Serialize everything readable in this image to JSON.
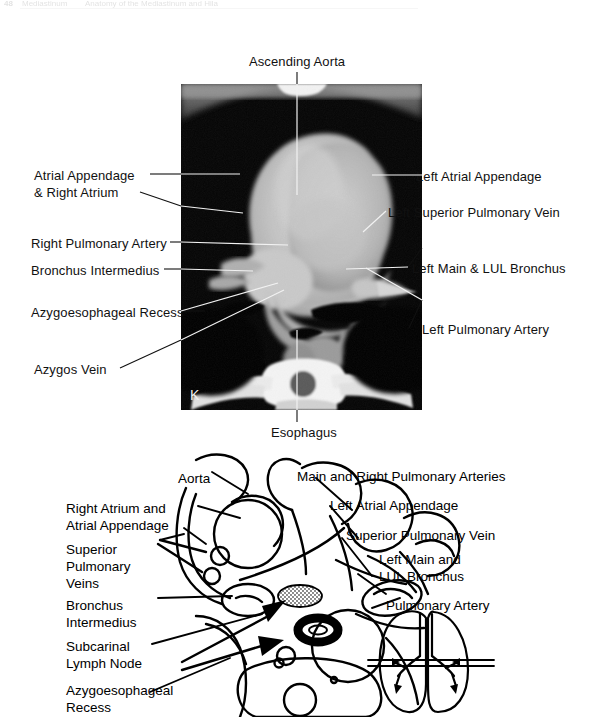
{
  "page": {
    "running_head": {
      "folio": "48",
      "part_a": "Mediastinum",
      "part_b": "Anatomy of the Mediastinum and Hila",
      "part_c": ""
    },
    "background": "#ffffff",
    "ink": "#111111"
  },
  "ct_panel": {
    "name": "coronal-ct-mediastinum",
    "orientation_marker": "K",
    "bounds": {
      "x": 181,
      "y": 84,
      "width": 241,
      "height": 326
    },
    "annotations": [
      {
        "id": "ascending-aorta",
        "text": "Ascending Aorta",
        "side": "top",
        "x": 249,
        "y": 54
      },
      {
        "id": "atrial-appendage-right-atrium",
        "text": "Atrial Appendage\n& Right Atrium",
        "side": "left",
        "x": 34,
        "y": 168
      },
      {
        "id": "right-pulmonary-artery",
        "text": "Right Pulmonary Artery",
        "side": "left",
        "x": 31,
        "y": 236
      },
      {
        "id": "bronchus-intermedius",
        "text": "Bronchus Intermedius",
        "side": "left",
        "x": 31,
        "y": 263
      },
      {
        "id": "azygoesophageal-recess",
        "text": "Azygoesophageal Recess",
        "side": "left",
        "x": 31,
        "y": 305
      },
      {
        "id": "azygos-vein",
        "text": "Azygos Vein",
        "side": "left",
        "x": 34,
        "y": 362
      },
      {
        "id": "left-atrial-appendage",
        "text": "Left Atrial Appendage",
        "side": "right",
        "x": 416,
        "y": 169
      },
      {
        "id": "left-superior-pulmonary-vein",
        "text": "Left Superior Pulmonary Vein",
        "side": "right",
        "x": 388,
        "y": 205
      },
      {
        "id": "left-main-lul-bronchus",
        "text": "Left Main & LUL Bronchus",
        "side": "right",
        "x": 412,
        "y": 261
      },
      {
        "id": "left-pulmonary-artery",
        "text": "Left Pulmonary Artery",
        "side": "right",
        "x": 422,
        "y": 322
      },
      {
        "id": "esophagus",
        "text": "Esophagus",
        "side": "bottom",
        "x": 271,
        "y": 425
      }
    ]
  },
  "diagram_panel": {
    "name": "mediastinum-line-drawing",
    "labels": [
      {
        "id": "aorta",
        "text": "Aorta",
        "x": 178,
        "y": 470
      },
      {
        "id": "main-and-right-pulmonary-arteries",
        "text": "Main and Right Pulmonary Arteries",
        "x": 297,
        "y": 468
      },
      {
        "id": "right-atrium-and-atrial-appendage",
        "text": "Right Atrium and\nAtrial Appendage",
        "x": 66,
        "y": 500
      },
      {
        "id": "left-atrial-appendage",
        "text": "Left Atrial Appendage",
        "x": 330,
        "y": 497
      },
      {
        "id": "superior-pulmonary-veins",
        "text": "Superior\nPulmonary\nVeins",
        "x": 66,
        "y": 541
      },
      {
        "id": "superior-pulmonary-vein",
        "text": "Superior Pulmonary Vein",
        "x": 346,
        "y": 527
      },
      {
        "id": "left-main-and-lul-bronchus",
        "text": "Left Main and\nLUL Bronchus",
        "x": 379,
        "y": 551
      },
      {
        "id": "bronchus-intermedius",
        "text": "Bronchus\nIntermedius",
        "x": 66,
        "y": 597
      },
      {
        "id": "pulmonary-artery",
        "text": "Pulmonary Artery",
        "x": 386,
        "y": 597
      },
      {
        "id": "subcarinal-lymph-node",
        "text": "Subcarinal\nLymph Node",
        "x": 66,
        "y": 638
      },
      {
        "id": "azygoesophageal-recess",
        "text": "Azygoesophageal\nRecess",
        "x": 66,
        "y": 682
      }
    ],
    "thorax_key": {
      "id": "thorax-level-key",
      "description": "small lung outline with horizontal section-level lines"
    }
  }
}
